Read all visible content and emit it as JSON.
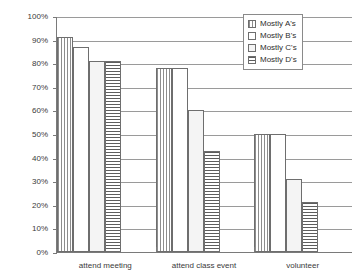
{
  "chart_data": {
    "type": "bar",
    "title": "",
    "xlabel": "",
    "ylabel": "",
    "categories": [
      "attend meeting",
      "attend class event",
      "volunteer"
    ],
    "series": [
      {
        "name": "Mostly A's",
        "pattern": "vertical-lines",
        "values": [
          91,
          78,
          50
        ]
      },
      {
        "name": "Mostly B's",
        "pattern": "empty",
        "values": [
          87,
          78,
          50
        ]
      },
      {
        "name": "Mostly C's",
        "pattern": "dotted",
        "values": [
          81,
          60,
          31
        ]
      },
      {
        "name": "Mostly D's",
        "pattern": "horizontal-lines",
        "values": [
          81,
          43,
          21
        ]
      }
    ],
    "ylim": [
      0,
      100
    ],
    "ytick_labels": [
      "0%",
      "10%",
      "20%",
      "30%",
      "40%",
      "50%",
      "60%",
      "70%",
      "80%",
      "90%",
      "100%"
    ],
    "ytick_values": [
      0,
      10,
      20,
      30,
      40,
      50,
      60,
      70,
      80,
      90,
      100
    ],
    "grid": true,
    "legend_position": "top-right"
  },
  "colors": {
    "axis": "#7a7a7a",
    "gridline": "#9a9a9a",
    "bar_border": "#6e6e6e",
    "text": "#3a3a3a",
    "background": "#ffffff"
  }
}
